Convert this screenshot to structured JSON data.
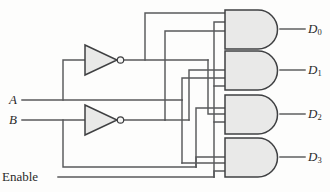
{
  "diagram": {
    "type": "logic-circuit",
    "background_color": "#fdfdfc",
    "wire_color": "#58595b",
    "gate_fill_color": "#e9e9e8",
    "gate_stroke_color": "#3f4042"
  },
  "inputs": [
    {
      "id": "A",
      "label": "A",
      "style": "italic",
      "y": 100
    },
    {
      "id": "B",
      "label": "B",
      "style": "italic",
      "y": 120
    },
    {
      "id": "Enable",
      "label": "Enable",
      "style": "plain",
      "y": 177
    }
  ],
  "outputs": [
    {
      "id": "D0",
      "label": "D",
      "subscript": "0",
      "y": 29
    },
    {
      "id": "D1",
      "label": "D",
      "subscript": "1",
      "y": 70
    },
    {
      "id": "D2",
      "label": "D",
      "subscript": "2",
      "y": 114
    },
    {
      "id": "D3",
      "label": "D",
      "subscript": "3",
      "y": 157
    }
  ],
  "gates": [
    {
      "id": "inv-A",
      "type": "NOT",
      "inputs": [
        "A"
      ],
      "output": "A-not"
    },
    {
      "id": "inv-B",
      "type": "NOT",
      "inputs": [
        "B"
      ],
      "output": "B-not"
    },
    {
      "id": "and-D0",
      "type": "AND",
      "inputs": [
        "A-not",
        "B-not",
        "Enable"
      ],
      "output": "D0"
    },
    {
      "id": "and-D1",
      "type": "AND",
      "inputs": [
        "A",
        "B-not",
        "Enable"
      ],
      "output": "D1"
    },
    {
      "id": "and-D2",
      "type": "AND",
      "inputs": [
        "A-not",
        "B",
        "Enable"
      ],
      "output": "D2"
    },
    {
      "id": "and-D3",
      "type": "AND",
      "inputs": [
        "A",
        "B",
        "Enable"
      ],
      "output": "D3"
    }
  ]
}
